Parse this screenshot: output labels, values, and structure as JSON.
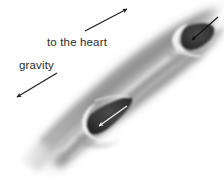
{
  "figure": {
    "background_color": "#ffffff",
    "width": 224,
    "height": 179,
    "style": "grayscale anatomical illustration"
  },
  "labels": {
    "heart": "to the heart",
    "gravity": "gravity",
    "text_color": "#2b2b2b"
  },
  "arrows": {
    "heart": {
      "name": "to-the-heart-arrow",
      "direction": "up-right",
      "color": "#1a1a1a",
      "from_x": 85,
      "from_y": 31,
      "to_x": 127,
      "to_y": 9
    },
    "gravity": {
      "name": "gravity-arrow",
      "direction": "down-left",
      "color": "#1a1a1a",
      "from_x": 57,
      "from_y": 73,
      "to_x": 17,
      "to_y": 97
    },
    "upper_valve_flow": {
      "name": "upper-valve-backflow-arrow",
      "direction": "down-left",
      "color": "#111111",
      "from_x": 216,
      "from_y": 19,
      "to_x": 188,
      "to_y": 42
    },
    "lower_valve_flow": {
      "name": "lower-valve-backflow-arrow",
      "direction": "down-left",
      "color": "#f2f2f2",
      "from_x": 125,
      "from_y": 108,
      "to_x": 96,
      "to_y": 128
    }
  },
  "vein": {
    "name": "vein-vessel",
    "orientation": "diagonal lower-left to upper-right",
    "wall_color_light": "#e6e6e6",
    "wall_color_mid": "#9a9a9a",
    "wall_color_dark": "#5a5a5a",
    "lumen_color": "#bdbdbd",
    "valve_pocket_color": "#3a3a3a",
    "valves": [
      {
        "name": "upper-valve",
        "position": "upper right",
        "cx": 193,
        "cy": 40
      },
      {
        "name": "lower-valve",
        "position": "lower left",
        "cx": 102,
        "cy": 122
      }
    ]
  }
}
